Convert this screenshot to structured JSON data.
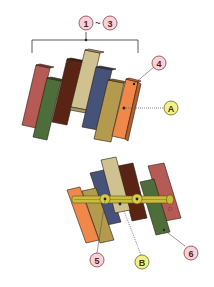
{
  "callouts": {
    "top_range": {
      "from": "1",
      "sep": "~",
      "to": "3"
    },
    "part4": "4",
    "partA": "A",
    "part5": "5",
    "partB": "B",
    "part6": "6"
  },
  "colors": {
    "callout_number_fill": "#f6d3d6",
    "callout_number_stroke": "#8a3a46",
    "callout_letter_fill": "#f3f08a",
    "callout_letter_stroke": "#6b6a1e",
    "slat_red": "#b65a55",
    "slat_green": "#4d6e3a",
    "slat_brown": "#5a2414",
    "slat_tan": "#cfc190",
    "slat_navy": "#45527a",
    "slat_ochre": "#b39a4c",
    "slat_orange": "#f0884a",
    "rod": "#c9bb3c"
  }
}
